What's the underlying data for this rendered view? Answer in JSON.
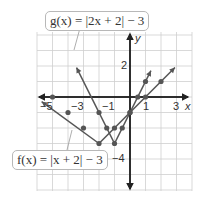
{
  "chart_data": {
    "type": "line",
    "title": "",
    "xlabel": "x",
    "ylabel": "y",
    "xlim": [
      -6,
      4
    ],
    "ylim": [
      -6,
      4
    ],
    "grid": true,
    "x_ticks": [
      "−5",
      "−3",
      "−1",
      "1",
      "3"
    ],
    "y_ticks": [
      "2",
      "−4"
    ],
    "series": [
      {
        "name": "f(x) = |x + 2| − 3",
        "label": "f(x) = |x + 2| − 3",
        "points": [
          [
            -5,
            0
          ],
          [
            -4,
            -1
          ],
          [
            -3,
            -2
          ],
          [
            -2,
            -3
          ],
          [
            -1,
            -2
          ],
          [
            0,
            -1
          ],
          [
            1,
            0
          ],
          [
            2,
            1
          ]
        ],
        "color": "#555555"
      },
      {
        "name": "g(x) = |2x + 2| − 3",
        "label": "g(x) = |2x + 2| − 3",
        "points": [
          [
            -2,
            -1
          ],
          [
            -1.5,
            -2
          ],
          [
            -1,
            -3
          ],
          [
            -0.5,
            -2
          ],
          [
            0,
            -1
          ],
          [
            0.5,
            0
          ],
          [
            1,
            1
          ]
        ],
        "color": "#555555"
      }
    ]
  },
  "labels": {
    "g": "g(x) = |2x + 2| − 3",
    "f": "f(x) = |x + 2| − 3",
    "x_axis": "x",
    "y_axis": "y"
  }
}
